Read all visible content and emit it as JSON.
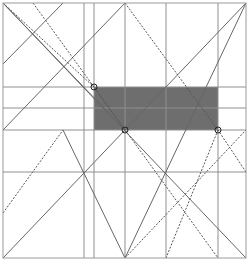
{
  "diagram": {
    "type": "geometric-construction",
    "width": 249,
    "height": 261,
    "colors": {
      "background": "#ffffff",
      "frame": "#9a9a9a",
      "grid": "#8f8f8f",
      "line": "#666666",
      "dashed": "#555555",
      "shade": "#6e6e6e",
      "marker": "#222222"
    },
    "frame": {
      "x": 3,
      "y": 3,
      "w": 243,
      "h": 255
    },
    "shaded_rect": {
      "x": 94,
      "y": 87,
      "w": 124,
      "h": 43
    },
    "verticals": [
      84,
      94,
      125,
      166,
      218
    ],
    "horizontals": [
      87,
      108,
      130,
      172
    ],
    "solid_lines": [
      [
        3,
        3,
        125,
        130
      ],
      [
        3,
        3,
        246,
        258
      ],
      [
        63,
        3,
        3,
        64
      ],
      [
        125,
        3,
        3,
        130
      ],
      [
        3,
        258,
        246,
        3
      ],
      [
        125,
        258,
        246,
        3
      ],
      [
        63,
        130,
        125,
        258
      ],
      [
        94,
        87,
        125,
        130
      ]
    ],
    "dashed_lines": [
      [
        33,
        3,
        218,
        258
      ],
      [
        3,
        213,
        63,
        130
      ],
      [
        125,
        3,
        218,
        130
      ],
      [
        218,
        130,
        166,
        258
      ],
      [
        246,
        172,
        218,
        130
      ],
      [
        3,
        3,
        94,
        87
      ],
      [
        125,
        258,
        246,
        130
      ]
    ],
    "markers": [
      {
        "cx": 94,
        "cy": 87,
        "r": 3
      },
      {
        "cx": 125,
        "cy": 130,
        "r": 3
      },
      {
        "cx": 218,
        "cy": 130,
        "r": 3
      }
    ]
  }
}
